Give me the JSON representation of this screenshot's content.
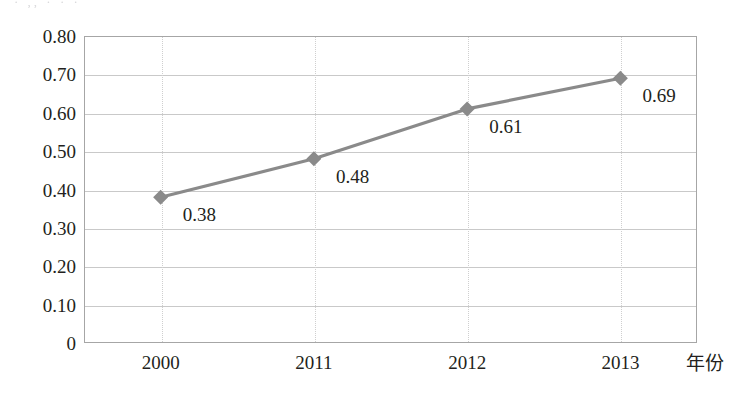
{
  "artifact": {
    "top_cut_text": "· ,,  ·   ·   ·"
  },
  "chart_data": {
    "type": "line",
    "title": "",
    "subtitle": "",
    "xlabel": "年份",
    "ylabel": "",
    "categories": [
      "2000",
      "2011",
      "2012",
      "2013"
    ],
    "values": [
      0.38,
      0.48,
      0.61,
      0.69
    ],
    "series": [
      {
        "name": "",
        "values": [
          0.38,
          0.48,
          0.61,
          0.69
        ],
        "point_labels": [
          "0.38",
          "0.48",
          "0.61",
          "0.69"
        ],
        "line_color": "#8a8a8a",
        "marker": "diamond",
        "marker_color": "#8a8a8a"
      }
    ],
    "ylim": [
      0,
      0.8
    ],
    "yticks": [
      0,
      0.1,
      0.2,
      0.3,
      0.4,
      0.5,
      0.6,
      0.7,
      0.8
    ],
    "ytick_labels": [
      "0",
      "0.10",
      "0.20",
      "0.30",
      "0.40",
      "0.50",
      "0.60",
      "0.70",
      "0.80"
    ],
    "xtick_labels": [
      "2000",
      "2011",
      "2012",
      "2013"
    ],
    "grid": {
      "horizontal": true,
      "horizontal_style": "solid",
      "horizontal_color": "#c9c9c9",
      "vertical": true,
      "vertical_style": "dotted",
      "vertical_color": "#cfcfcf"
    },
    "legend": {
      "visible": false,
      "position": "none",
      "entries": []
    },
    "plot_border_color": "#a6a6a6",
    "background_color": "#ffffff"
  }
}
